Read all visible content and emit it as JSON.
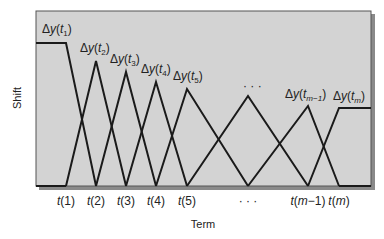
{
  "chart_data": {
    "type": "line",
    "title": "",
    "xlabel": "Term",
    "ylabel": "Shift",
    "grid": false,
    "legend": null,
    "background": "#d3d3d3",
    "line_color": "#1a1a1a",
    "x_ticks": [
      {
        "label": "t(1)",
        "var": "t",
        "arg": "1",
        "x": 66
      },
      {
        "label": "t(2)",
        "var": "t",
        "arg": "2",
        "x": 96
      },
      {
        "label": "t(3)",
        "var": "t",
        "arg": "3",
        "x": 126
      },
      {
        "label": "t(4)",
        "var": "t",
        "arg": "4",
        "x": 156
      },
      {
        "label": "t(5)",
        "var": "t",
        "arg": "5",
        "x": 187
      },
      {
        "label": "...",
        "var": "",
        "arg": "",
        "x": 248
      },
      {
        "label": "t(m−1)",
        "var": "t",
        "arg": "m−1",
        "x": 308
      },
      {
        "label": "t(m)",
        "var": "t",
        "arg": "m",
        "x": 339
      }
    ],
    "peak_labels": [
      {
        "label": "Δy(t1)",
        "sub": "1",
        "x": 42,
        "y": 33
      },
      {
        "label": "Δy(t2)",
        "sub": "2",
        "x": 80,
        "y": 52
      },
      {
        "label": "Δy(t3)",
        "sub": "3",
        "x": 110,
        "y": 63
      },
      {
        "label": "Δy(t4)",
        "sub": "4",
        "x": 141,
        "y": 73
      },
      {
        "label": "Δy(t5)",
        "sub": "5",
        "x": 173,
        "y": 80
      },
      {
        "label": "...",
        "sub": "",
        "x": 243,
        "y": 90
      },
      {
        "label": "Δy(tm−1)",
        "sub": "m−1",
        "x": 285,
        "y": 98
      },
      {
        "label": "Δy(tm)",
        "sub": "m",
        "x": 333,
        "y": 100
      }
    ],
    "series": [
      {
        "name": "Δy(t1)",
        "points": [
          [
            36,
            43
          ],
          [
            66,
            43
          ],
          [
            96,
            186
          ]
        ]
      },
      {
        "name": "Δy(t2)",
        "points": [
          [
            66,
            186
          ],
          [
            96,
            61
          ],
          [
            126,
            186
          ]
        ]
      },
      {
        "name": "Δy(t3)",
        "points": [
          [
            96,
            186
          ],
          [
            126,
            72
          ],
          [
            156,
            186
          ]
        ]
      },
      {
        "name": "Δy(t4)",
        "points": [
          [
            126,
            186
          ],
          [
            156,
            82
          ],
          [
            187,
            186
          ]
        ]
      },
      {
        "name": "Δy(t5)",
        "points": [
          [
            156,
            186
          ],
          [
            187,
            89
          ],
          [
            248,
            186
          ]
        ]
      },
      {
        "name": "...",
        "points": [
          [
            187,
            186
          ],
          [
            248,
            96
          ],
          [
            308,
            186
          ]
        ]
      },
      {
        "name": "Δy(tm−1)",
        "points": [
          [
            248,
            186
          ],
          [
            308,
            106
          ],
          [
            339,
            186
          ]
        ]
      },
      {
        "name": "Δy(tm)",
        "points": [
          [
            308,
            186
          ],
          [
            339,
            108
          ],
          [
            371,
            108
          ]
        ]
      }
    ],
    "baseline_segments": [
      [
        [
          36,
          186
        ],
        [
          66,
          186
        ]
      ],
      [
        [
          339,
          186
        ],
        [
          371,
          186
        ]
      ]
    ]
  },
  "labels": {
    "y_axis": "Shift",
    "x_axis": "Term"
  }
}
